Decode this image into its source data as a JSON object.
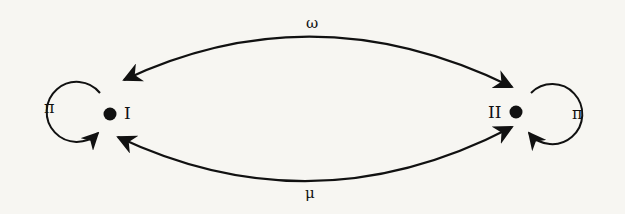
{
  "diagram": {
    "type": "state-transition",
    "nodes": [
      {
        "id": "I",
        "label": "I"
      },
      {
        "id": "II",
        "label": "II"
      }
    ],
    "edges": [
      {
        "from": "I",
        "to": "II",
        "label": "ω",
        "direction": "bidirectional",
        "position": "top"
      },
      {
        "from": "I",
        "to": "II",
        "label": "μ",
        "direction": "bidirectional",
        "position": "bottom"
      },
      {
        "from": "I",
        "to": "I",
        "label": "π",
        "type": "self-loop"
      },
      {
        "from": "II",
        "to": "II",
        "label": "π",
        "type": "self-loop"
      }
    ],
    "colors": {
      "stroke": "#111111",
      "background": "#f7f6f2"
    }
  }
}
